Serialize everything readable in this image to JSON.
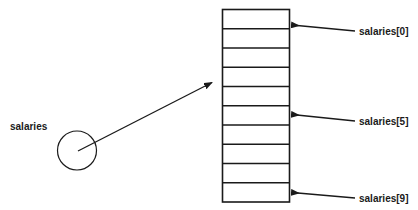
{
  "diagram": {
    "type": "array-pointer-diagram",
    "background_color": "#ffffff",
    "stroke_color": "#1a1a1a",
    "pointer": {
      "label": "salaries",
      "shape": "circle",
      "icon": "pointer-circle"
    },
    "array": {
      "cell_count": 10,
      "indices": [
        0,
        1,
        2,
        3,
        4,
        5,
        6,
        7,
        8,
        9
      ]
    },
    "callouts": [
      {
        "label": "salaries[0]",
        "index": 0
      },
      {
        "label": "salaries[5]",
        "index": 5
      },
      {
        "label": "salaries[9]",
        "index": 9
      }
    ]
  }
}
